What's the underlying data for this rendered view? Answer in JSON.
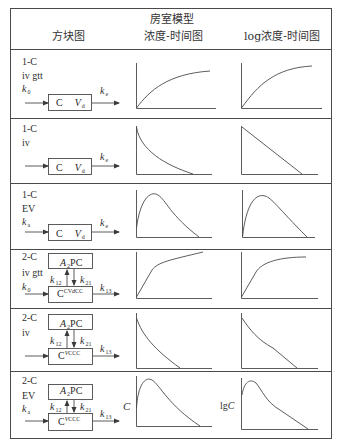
{
  "header": {
    "title": "房室模型",
    "col1": "方块图",
    "col2": "浓度-时间图",
    "col3": "log浓度-时间图"
  },
  "rows": [
    {
      "model": "1-C",
      "route": "iv gtt",
      "input_k": "k",
      "input_k_sub": "0",
      "central_c": "C",
      "central_v": "V",
      "central_v_sub": "d",
      "output_k": "k",
      "output_k_sub": "e",
      "conc_curve": "rise-plateau",
      "log_curve": "rise-plateau"
    },
    {
      "model": "1-C",
      "route": "iv",
      "central_c": "C",
      "central_v": "V",
      "central_v_sub": "d",
      "output_k": "k",
      "output_k_sub": "e",
      "conc_curve": "exponential-decay",
      "log_curve": "linear-decay"
    },
    {
      "model": "1-C",
      "route": "EV",
      "input_k": "k",
      "input_k_sub": "a",
      "central_c": "C",
      "central_v": "V",
      "central_v_sub": "d",
      "output_k": "k",
      "output_k_sub": "e",
      "conc_curve": "absorption-peak",
      "log_curve": "absorption-peak-linear-tail"
    },
    {
      "model": "2-C",
      "route": "iv gtt",
      "input_k": "k",
      "input_k_sub": "0",
      "peripheral": "A",
      "peripheral_sub": "2",
      "peripheral_rest": "PC",
      "k12": "k",
      "k12_sub": "12",
      "k21": "k",
      "k21_sub": "21",
      "central": "C",
      "central_sup": "CV",
      "central_sup2": "d",
      "central_sup3": "CC",
      "output_k": "k",
      "output_k_sub": "13",
      "conc_curve": "biphasic-rise",
      "log_curve": "rise-plateau"
    },
    {
      "model": "2-C",
      "route": "iv",
      "peripheral": "A",
      "peripheral_sub": "2",
      "peripheral_rest": "PC",
      "k12": "k",
      "k12_sub": "12",
      "k21": "k",
      "k21_sub": "21",
      "central": "C",
      "central_sup": "V",
      "central_sup2": "C",
      "central_sup3": "CC",
      "output_k": "k",
      "output_k_sub": "13",
      "conc_curve": "biexponential-decay",
      "log_curve": "biphasic-linear-decay"
    },
    {
      "model": "2-C",
      "route": "EV",
      "input_k": "k",
      "input_k_sub": "a",
      "peripheral": "A",
      "peripheral_sub": "2",
      "peripheral_rest": "PC",
      "k12": "k",
      "k12_sub": "12",
      "k21": "k",
      "k21_sub": "21",
      "central": "C",
      "central_sup": "V",
      "central_sup2": "C",
      "central_sup3": "CC",
      "output_k": "k",
      "output_k_sub": "13",
      "conc_curve": "absorption-peak",
      "log_curve": "absorption-peak-biphasic",
      "conc_axis_label": "C",
      "log_axis_label": "lgC"
    }
  ],
  "colors": {
    "line": "#4a4a4a",
    "text": "#2a2a2a",
    "background": "#ffffff"
  }
}
